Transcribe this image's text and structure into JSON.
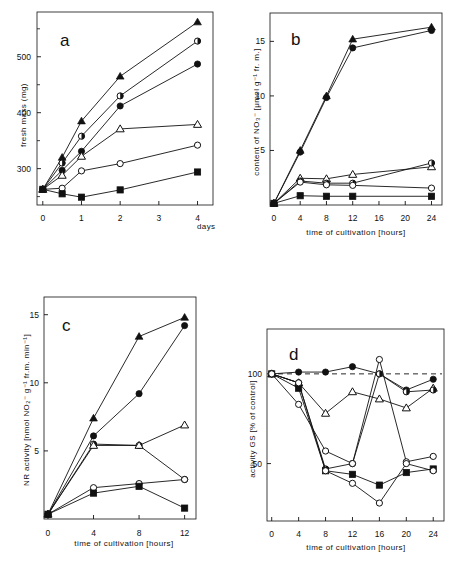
{
  "figure": {
    "panels": [
      "a",
      "b",
      "c",
      "d"
    ],
    "background": "#ffffff",
    "line_color": "#111111"
  },
  "chart_data": [
    {
      "type": "line",
      "panel_label": "a",
      "title": "",
      "xlabel": "days",
      "ylabel": "fresh mass  (mg)",
      "x": [
        0,
        0.5,
        1,
        2,
        4
      ],
      "xticks": [
        0,
        1,
        2,
        3,
        4
      ],
      "xlim": [
        -0.15,
        4.4
      ],
      "yticks": [
        300,
        400,
        500
      ],
      "ylim": [
        235,
        580
      ],
      "grid": false,
      "legend": "none",
      "series": [
        {
          "name": "filled-triangle",
          "marker": "filled-triangle",
          "values": [
            263,
            320,
            385,
            465,
            562
          ]
        },
        {
          "name": "half-filled-circle",
          "marker": "half-filled-circle",
          "values": [
            263,
            310,
            358,
            430,
            528
          ]
        },
        {
          "name": "filled-circle",
          "marker": "filled-circle",
          "values": [
            263,
            297,
            331,
            412,
            487
          ]
        },
        {
          "name": "open-triangle",
          "marker": "open-triangle",
          "values": [
            263,
            288,
            322,
            371,
            379
          ]
        },
        {
          "name": "open-circle",
          "marker": "open-circle",
          "values": [
            263,
            265,
            296,
            309,
            342
          ]
        },
        {
          "name": "filled-square",
          "marker": "filled-square",
          "values": [
            263,
            255,
            249,
            262,
            294
          ]
        }
      ]
    },
    {
      "type": "line",
      "panel_label": "b",
      "title": "",
      "xlabel": "time of cultivation [hours]",
      "ylabel": "content of NO₃⁻  [μmol g⁻¹ fr. m.]",
      "x": [
        0,
        4,
        8,
        12,
        24
      ],
      "xticks": [
        0,
        4,
        8,
        12,
        16,
        20,
        24
      ],
      "xlim": [
        -0.6,
        25.6
      ],
      "yticks": [
        5,
        10,
        15
      ],
      "ylim": [
        0,
        17.6
      ],
      "grid": false,
      "legend": "none",
      "series": [
        {
          "name": "filled-triangle",
          "marker": "filled-triangle",
          "values": [
            0.15,
            5.0,
            10.0,
            15.2,
            16.3
          ]
        },
        {
          "name": "filled-circle",
          "marker": "filled-circle",
          "values": [
            0.15,
            4.85,
            9.85,
            14.4,
            16.0
          ]
        },
        {
          "name": "open-triangle",
          "marker": "open-triangle",
          "values": [
            0.15,
            2.45,
            2.4,
            2.8,
            3.5
          ]
        },
        {
          "name": "half-filled-circle",
          "marker": "half-filled-circle",
          "values": [
            0.15,
            2.2,
            2.0,
            2.0,
            3.85
          ]
        },
        {
          "name": "open-circle",
          "marker": "open-circle",
          "values": [
            0.15,
            2.1,
            1.85,
            1.8,
            1.55
          ]
        },
        {
          "name": "filled-square",
          "marker": "filled-square",
          "values": [
            0.15,
            0.85,
            0.8,
            0.8,
            0.8
          ]
        }
      ]
    },
    {
      "type": "line",
      "panel_label": "c",
      "title": "",
      "xlabel": "time of cultivation [hours]",
      "ylabel": "NR activity   [nmol NO₂⁻ g⁻¹ fr.m. min⁻¹]",
      "x": [
        0,
        4,
        8,
        12
      ],
      "xticks": [
        0,
        4,
        8,
        12
      ],
      "xlim": [
        -0.35,
        13.0
      ],
      "yticks": [
        5,
        10,
        15
      ],
      "ylim": [
        0,
        16.3
      ],
      "grid": false,
      "legend": "none",
      "series": [
        {
          "name": "filled-triangle",
          "marker": "filled-triangle",
          "values": [
            0.35,
            7.4,
            13.4,
            14.8
          ]
        },
        {
          "name": "filled-circle",
          "marker": "filled-circle",
          "values": [
            0.35,
            6.1,
            9.2,
            14.2
          ]
        },
        {
          "name": "half-filled-circle",
          "marker": "half-filled-circle",
          "values": [
            0.35,
            5.5,
            5.4,
            2.9
          ]
        },
        {
          "name": "open-triangle",
          "marker": "open-triangle",
          "values": [
            0.35,
            5.4,
            5.4,
            6.9
          ]
        },
        {
          "name": "open-circle",
          "marker": "open-circle",
          "values": [
            0.35,
            2.3,
            2.6,
            2.9
          ]
        },
        {
          "name": "filled-square",
          "marker": "filled-square",
          "values": [
            0.35,
            1.9,
            2.4,
            0.8
          ]
        }
      ]
    },
    {
      "type": "line",
      "panel_label": "d",
      "title": "",
      "xlabel": "time of cultivation [hours]",
      "ylabel": "activity GS   [% of control]",
      "x": [
        0,
        4,
        8,
        12,
        16,
        20,
        24
      ],
      "xticks": [
        0,
        4,
        8,
        12,
        16,
        20,
        24
      ],
      "xlim": [
        -0.7,
        25.6
      ],
      "yticks": [
        50,
        100
      ],
      "ylim": [
        18,
        125
      ],
      "grid": false,
      "reference_line": {
        "value": 100,
        "style": "dashed",
        "label": "100 % control"
      },
      "legend": "none",
      "series": [
        {
          "name": "filled-circle",
          "marker": "filled-circle",
          "values": [
            100,
            101,
            101,
            104,
            100,
            91,
            97
          ]
        },
        {
          "name": "open-triangle",
          "marker": "open-triangle",
          "values": [
            100,
            95,
            78,
            90,
            86,
            81,
            92
          ]
        },
        {
          "name": "half-filled-circle",
          "marker": "half-filled-circle",
          "values": [
            100,
            95,
            47,
            50,
            100,
            90,
            91
          ]
        },
        {
          "name": "open-circle",
          "marker": "open-circle",
          "values": [
            100,
            83,
            57,
            50,
            108,
            51,
            54
          ]
        },
        {
          "name": "filled-square",
          "marker": "filled-square",
          "values": [
            100,
            92,
            46,
            44,
            38,
            45,
            47
          ]
        },
        {
          "name": "open-circle-2",
          "marker": "open-circle",
          "values": [
            100,
            95,
            46,
            39,
            28,
            50,
            46
          ]
        }
      ]
    }
  ]
}
